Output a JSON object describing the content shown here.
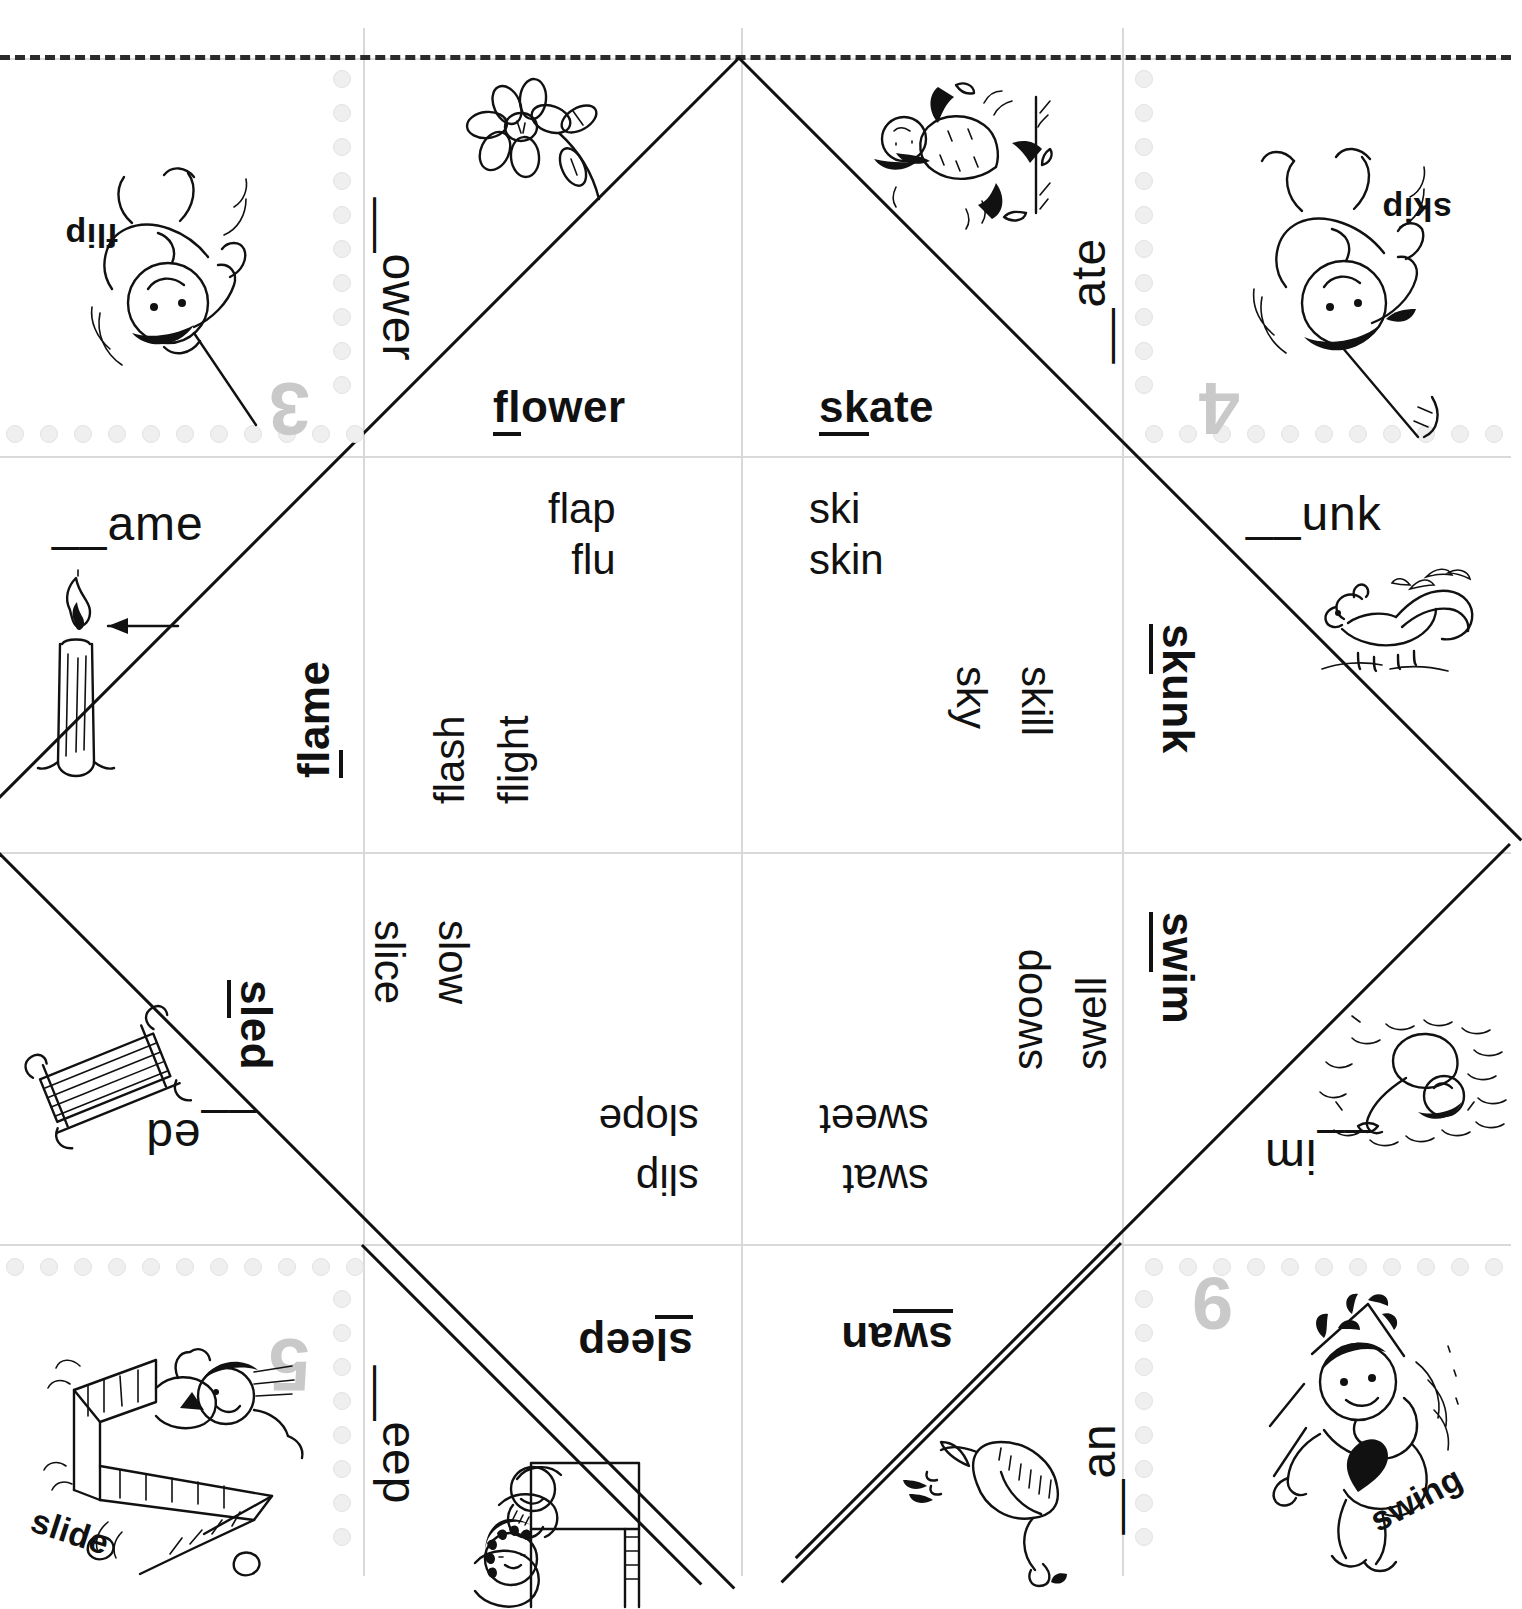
{
  "worksheet": {
    "type": "consonant-blend fortune teller / cootie catcher",
    "cut_line_label": "dashed cut line"
  },
  "cells": {
    "r0c0": {
      "label": "flip",
      "number": "3",
      "picture": "child-swinging-on-rope"
    },
    "r0c1": {
      "prompt": "__ower",
      "answer_pre": "fl",
      "answer_post": "ower",
      "picture": "flower"
    },
    "r0c2": {
      "prompt": "__ate",
      "answer_pre": "sk",
      "answer_post": "ate",
      "picture": "child-skating"
    },
    "r0c3": {
      "label": "skip",
      "number": "4",
      "picture": "girl-skipping-rope"
    },
    "r1c0": {
      "prompt": "__ame",
      "answer_pre": "fl",
      "answer_post": "ame",
      "picture": "candle-flame-with-arrow"
    },
    "r1c1": {
      "words_up": [
        "flap",
        "flu"
      ],
      "words_rot": [
        "flash",
        "flight"
      ]
    },
    "r1c2": {
      "words_up": [
        "ski",
        "skin"
      ],
      "words_rot": [
        "sky",
        "skill"
      ]
    },
    "r1c3": {
      "prompt": "__unk",
      "answer_pre": "sk",
      "answer_post": "unk",
      "picture": "skunk"
    },
    "r2c0": {
      "prompt": "__ed",
      "answer_pre": "sl",
      "answer_post": "ed",
      "picture": "sled"
    },
    "r2c1": {
      "words_rot": [
        "slice",
        "slow"
      ],
      "words_flip": [
        "slope",
        "slip"
      ]
    },
    "r2c2": {
      "words_rot": [
        "swell",
        "swoop"
      ],
      "words_flip": [
        "sweet",
        "swat"
      ]
    },
    "r2c3": {
      "answer_pre": "sw",
      "answer_post": "im",
      "prompt": "__im",
      "picture": "child-swimming"
    },
    "r3c0": {
      "label": "slide",
      "number": "5",
      "picture": "child-on-slide"
    },
    "r3c1": {
      "prompt": "__eep",
      "answer_pre": "sl",
      "answer_post": "eep",
      "picture": "children-bunk-bed-sleeping"
    },
    "r3c2": {
      "answer_pre": "sw",
      "answer_post": "an",
      "prompt": "__an",
      "picture": "swan"
    },
    "r3c3": {
      "label": "swing",
      "number": "6",
      "picture": "girl-on-swing"
    }
  },
  "colors": {
    "ink": "#111111",
    "grid": "#d9d9d9",
    "perforation": "#efefef",
    "number_gray": "#c9c9c9"
  }
}
